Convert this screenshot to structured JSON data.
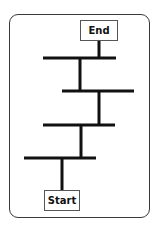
{
  "diagram": {
    "type": "ladder-flow",
    "nodes": {
      "end": {
        "label": "End"
      },
      "start": {
        "label": "Start"
      }
    },
    "rungs": 4,
    "colors": {
      "line": "#111111",
      "frame": "#3a3a3a",
      "box_border": "#555555",
      "background": "#ffffff"
    }
  }
}
